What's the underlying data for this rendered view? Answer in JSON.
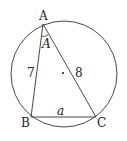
{
  "diagram": {
    "type": "triangle inscribed in circle",
    "vertices": {
      "A": {
        "label": "A"
      },
      "B": {
        "label": "B"
      },
      "C": {
        "label": "C"
      }
    },
    "sides": {
      "AB": "7",
      "AC": "8",
      "BC": "a"
    },
    "angle_label": "A",
    "center_marker": "·",
    "colors": {
      "stroke": "#333333",
      "text": "#222222",
      "background": "#ffffff"
    }
  }
}
